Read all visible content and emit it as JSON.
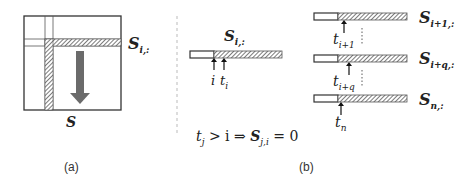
{
  "panel_a": {
    "caption": "(a)",
    "matrix_label": "S",
    "row_label_main": "S",
    "row_label_sub": "i,:"
  },
  "panel_b": {
    "caption": "(b)",
    "center_row": {
      "label_main": "S",
      "label_sub": "i,:",
      "arrow_labels": [
        "i",
        "t"
      ],
      "arrow_label_t_sub": "i"
    },
    "equation": {
      "lhs_t": "t",
      "lhs_t_sub": "j",
      "rest": " > i ⇒ ",
      "S": "S",
      "S_sub": "j,i",
      "rhs": " = 0"
    },
    "rows": [
      {
        "label_main": "S",
        "label_sub": "i+1,:",
        "t_main": "t",
        "t_sub": "i+1"
      },
      {
        "label_main": "S",
        "label_sub": "i+q,:",
        "t_main": "t",
        "t_sub": "i+q"
      },
      {
        "label_main": "S",
        "label_sub": "n,:",
        "t_main": "t",
        "t_sub": "n"
      }
    ]
  },
  "colors": {
    "stroke": "#333333",
    "arrow": "#6b6b6b",
    "divider": "#bbbbbb"
  }
}
